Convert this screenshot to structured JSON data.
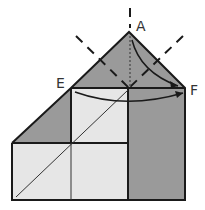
{
  "diagram": {
    "labels": {
      "a": "A",
      "e": "E",
      "f": "F"
    },
    "colors": {
      "dark_fill": "#9a9a9a",
      "light_fill": "#e6e6e6",
      "line": "#1a1a1a"
    }
  }
}
